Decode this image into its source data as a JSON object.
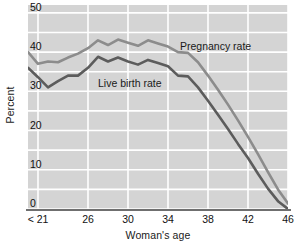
{
  "chart_data": {
    "type": "line",
    "title": "",
    "xlabel": "Woman's age",
    "ylabel": "Percent",
    "grid": true,
    "legend_position": "inline-annotation",
    "ylim": [
      0,
      52
    ],
    "yticks": [
      0,
      10,
      20,
      30,
      40,
      50
    ],
    "ytick_labels": [
      "0",
      "10",
      "20",
      "30",
      "40",
      "50"
    ],
    "xlim": [
      20,
      46
    ],
    "xticks": [
      21,
      26,
      30,
      34,
      38,
      42,
      46
    ],
    "xtick_labels": [
      "< 21",
      "26",
      "30",
      "34",
      "38",
      "42",
      "46"
    ],
    "x": [
      20,
      21,
      22,
      23,
      24,
      25,
      26,
      27,
      28,
      29,
      30,
      31,
      32,
      33,
      34,
      35,
      36,
      37,
      38,
      39,
      40,
      41,
      42,
      43,
      44,
      45,
      46
    ],
    "series": [
      {
        "name": "Pregnancy rate",
        "color": "#8c8c8c",
        "label_x": 35.2,
        "label_y": 41.5,
        "values": [
          40.0,
          37.0,
          37.6,
          37.4,
          38.6,
          39.6,
          41.0,
          43.0,
          41.8,
          43.2,
          42.4,
          41.6,
          43.0,
          42.2,
          41.4,
          40.0,
          39.8,
          37.4,
          34.0,
          30.4,
          26.6,
          22.6,
          18.4,
          14.0,
          9.4,
          5.0,
          1.4
        ]
      },
      {
        "name": "Live birth rate",
        "color": "#5c5c5c",
        "label_x": 27.0,
        "label_y": 32.2,
        "values": [
          36.0,
          33.6,
          31.0,
          32.6,
          34.0,
          34.0,
          36.0,
          38.8,
          37.6,
          38.6,
          37.6,
          36.8,
          38.0,
          37.2,
          36.4,
          34.0,
          33.8,
          31.0,
          27.6,
          24.0,
          20.4,
          16.6,
          13.0,
          9.0,
          5.2,
          2.0,
          0.0
        ]
      }
    ]
  }
}
